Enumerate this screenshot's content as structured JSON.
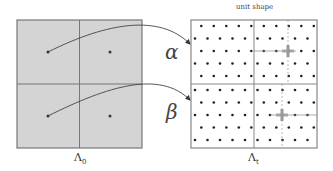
{
  "left_panel": {
    "label": "Λ",
    "label_sub": "0",
    "fill": "#d4d4d4",
    "stroke": "#777777",
    "x": 17,
    "y": 20,
    "w": 125,
    "h": 128,
    "dots": [
      [
        48,
        52
      ],
      [
        110,
        52
      ],
      [
        48,
        116
      ],
      [
        110,
        116
      ]
    ]
  },
  "right_panel": {
    "caption": "unit shape",
    "label": "Λ",
    "label_sub": "t",
    "fill": "#ffffff",
    "stroke": "#888888",
    "x": 191,
    "y": 20,
    "w": 126,
    "h": 128,
    "divider_x": 254,
    "divider_y": 84,
    "dot_color": "#222222",
    "marker_color": "#999999"
  },
  "mappings": [
    {
      "symbol": "α",
      "from": [
        48,
        52
      ],
      "to": [
        190,
        44
      ]
    },
    {
      "symbol": "β",
      "from": [
        48,
        116
      ],
      "to": [
        190,
        100
      ]
    }
  ]
}
